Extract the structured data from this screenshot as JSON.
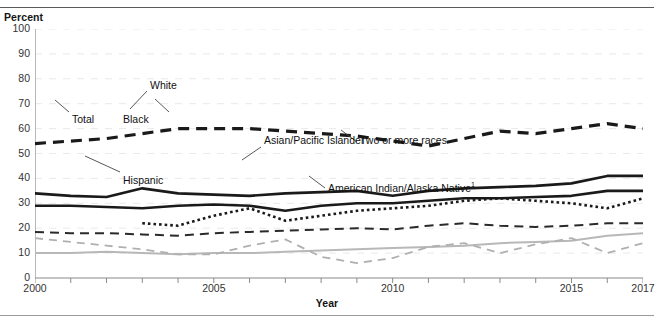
{
  "chart_data": {
    "type": "line",
    "title": "",
    "xlabel": "Year",
    "ylabel": "Percent",
    "ylim": [
      0,
      100
    ],
    "xlim": [
      2000,
      2017
    ],
    "ytick_step": 10,
    "yticks": [
      0,
      10,
      20,
      30,
      40,
      50,
      60,
      70,
      80,
      90,
      100
    ],
    "xticks": [
      2000,
      2001,
      2002,
      2003,
      2004,
      2005,
      2006,
      2007,
      2008,
      2009,
      2010,
      2011,
      2012,
      2013,
      2014,
      2015,
      2016,
      2017
    ],
    "xticklabels": [
      "2000",
      "2005",
      "2010",
      "2015",
      "2017"
    ],
    "xticklabel_years": [
      2000,
      2005,
      2010,
      2015,
      2017
    ],
    "grid": "horizontal-dashed-faint",
    "legend": "inline-callout-labels",
    "x": [
      2000,
      2001,
      2002,
      2003,
      2004,
      2005,
      2006,
      2007,
      2008,
      2009,
      2010,
      2011,
      2012,
      2013,
      2014,
      2015,
      2016,
      2017
    ],
    "series": [
      {
        "name": "Asian/Pacific Islander",
        "style": "heavy-dashed",
        "color": "#1a1a1a",
        "values": [
          54,
          55,
          56,
          58,
          60,
          60,
          60,
          59,
          58,
          57,
          55,
          53,
          56,
          59,
          58,
          60,
          62,
          60
        ]
      },
      {
        "name": "White",
        "style": "heavy-solid",
        "color": "#1a1a1a",
        "values": [
          34,
          33,
          32.5,
          36,
          34,
          33.5,
          33,
          34,
          34.5,
          35,
          33,
          35,
          36,
          36.5,
          37,
          38,
          41,
          41
        ]
      },
      {
        "name": "Total",
        "style": "heavy-solid",
        "color": "#1a1a1a",
        "values": [
          29,
          29,
          28.5,
          28,
          29,
          29.5,
          29,
          27,
          29,
          30,
          30,
          31,
          32,
          32,
          32.5,
          33,
          35,
          35
        ]
      },
      {
        "name": "Two or more races",
        "style": "dotted",
        "color": "#1a1a1a",
        "start_year": 2003,
        "values": [
          null,
          null,
          null,
          22,
          21,
          25,
          28,
          23,
          25,
          27,
          28,
          29,
          31,
          32,
          31,
          30,
          28,
          32
        ]
      },
      {
        "name": "Black",
        "style": "dashed",
        "color": "#2a2a2a",
        "values": [
          18.5,
          18,
          18,
          17.5,
          17,
          18,
          18.5,
          19,
          19.5,
          20,
          19.5,
          21,
          22,
          21,
          20.5,
          21,
          22,
          22
        ]
      },
      {
        "name": "Hispanic",
        "style": "light-solid",
        "color": "#b8b8b8",
        "values": [
          10,
          10,
          10.5,
          10,
          9.5,
          10,
          10,
          10.5,
          11,
          11.5,
          12,
          12.5,
          13,
          14,
          14.5,
          15,
          17,
          18
        ]
      },
      {
        "name": "American Indian/Alaska Native",
        "style": "light-dashed",
        "color": "#b0b0b0",
        "footnote": "1",
        "values": [
          16,
          14.5,
          13,
          11.5,
          9.5,
          9.5,
          13,
          15.5,
          8.5,
          6,
          8,
          12.5,
          14,
          10,
          13.5,
          16,
          10,
          14
        ]
      }
    ]
  },
  "axis": {
    "y_title": "Percent",
    "x_title": "Year"
  },
  "callouts": [
    {
      "id": "asian-pacific-islander",
      "label": "Asian/Pacific Islander"
    },
    {
      "id": "white",
      "label": "White"
    },
    {
      "id": "total",
      "label": "Total"
    },
    {
      "id": "black",
      "label": "Black"
    },
    {
      "id": "two-or-more-races",
      "label": "Two or more races"
    },
    {
      "id": "hispanic",
      "label": "Hispanic"
    },
    {
      "id": "american-indian-alaska-native",
      "label": "American Indian/Alaska Native",
      "footnote": "1"
    }
  ]
}
